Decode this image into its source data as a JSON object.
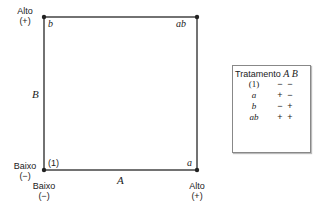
{
  "diagram": {
    "corners": {
      "top_left": "b",
      "top_right": "ab",
      "bottom_left": "(1)",
      "bottom_right": "a"
    },
    "axis_labels": {
      "x": "A",
      "y": "B"
    },
    "level_labels": {
      "y_high": {
        "text": "Alto",
        "sign": "(+)"
      },
      "y_low": {
        "text": "Baixo",
        "sign": "(−)"
      },
      "x_low": {
        "text": "Baixo",
        "sign": "(−)"
      },
      "x_high": {
        "text": "Alto",
        "sign": "(+)"
      }
    }
  },
  "table": {
    "header": {
      "col0": "Tratamento",
      "col1": "A",
      "col2": "B"
    },
    "rows": [
      {
        "treatment": "(1)",
        "A": "−",
        "B": "−"
      },
      {
        "treatment": "a",
        "A": "+",
        "B": "−"
      },
      {
        "treatment": "b",
        "A": "−",
        "B": "+"
      },
      {
        "treatment": "ab",
        "A": "+",
        "B": "+"
      }
    ]
  }
}
